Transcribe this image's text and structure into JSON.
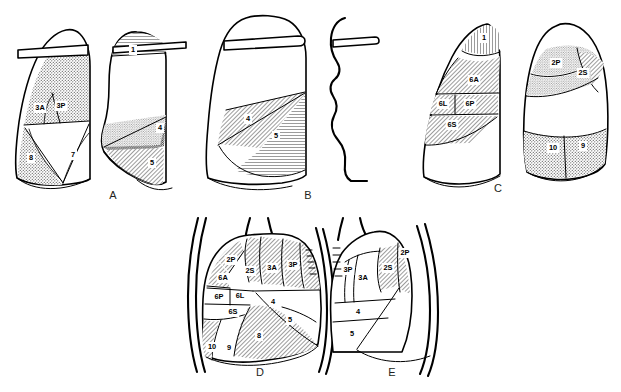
{
  "figure": {
    "background_color": "#ffffff",
    "ink_color": "#000000",
    "width": 621,
    "height": 392,
    "panels": [
      {
        "id": "A",
        "letter": "A",
        "letter_x": 113,
        "letter_y": 196,
        "description": "Right lung lateral and left lung lateral views",
        "segments": [
          {
            "label": "3A",
            "x": 40,
            "y": 108
          },
          {
            "label": "3P",
            "x": 61,
            "y": 106
          },
          {
            "label": "8",
            "x": 31,
            "y": 158
          },
          {
            "label": "7",
            "x": 73,
            "y": 155
          },
          {
            "label": "1",
            "x": 133,
            "y": 50
          },
          {
            "label": "4",
            "x": 160,
            "y": 128
          },
          {
            "label": "5",
            "x": 152,
            "y": 163
          }
        ]
      },
      {
        "id": "B",
        "letter": "B",
        "letter_x": 308,
        "letter_y": 196,
        "description": "Lung lateral view with middle lobe segments and profile trace",
        "segments": [
          {
            "label": "4",
            "x": 248,
            "y": 119
          },
          {
            "label": "5",
            "x": 276,
            "y": 136
          }
        ]
      },
      {
        "id": "C",
        "letter": "C",
        "letter_x": 498,
        "letter_y": 189,
        "description": "Right and left lung lateral views showing apical and superior segments",
        "segments": [
          {
            "label": "1",
            "x": 484,
            "y": 38
          },
          {
            "label": "6A",
            "x": 474,
            "y": 80
          },
          {
            "label": "6L",
            "x": 443,
            "y": 104
          },
          {
            "label": "6P",
            "x": 470,
            "y": 104
          },
          {
            "label": "6S",
            "x": 452,
            "y": 125
          },
          {
            "label": "2P",
            "x": 556,
            "y": 63
          },
          {
            "label": "2S",
            "x": 583,
            "y": 73
          },
          {
            "label": "10",
            "x": 553,
            "y": 148
          },
          {
            "label": "9",
            "x": 583,
            "y": 146
          }
        ]
      },
      {
        "id": "D",
        "letter": "D",
        "letter_x": 260,
        "letter_y": 373,
        "description": "Frontal view of right lung with all bronchopulmonary segments labelled",
        "segments": [
          {
            "label": "2P",
            "x": 231,
            "y": 260
          },
          {
            "label": "2S",
            "x": 250,
            "y": 271
          },
          {
            "label": "3A",
            "x": 272,
            "y": 268
          },
          {
            "label": "3P",
            "x": 293,
            "y": 265
          },
          {
            "label": "6A",
            "x": 223,
            "y": 278
          },
          {
            "label": "6P",
            "x": 219,
            "y": 297
          },
          {
            "label": "6L",
            "x": 240,
            "y": 296
          },
          {
            "label": "6S",
            "x": 233,
            "y": 312
          },
          {
            "label": "4",
            "x": 273,
            "y": 302
          },
          {
            "label": "5",
            "x": 290,
            "y": 320
          },
          {
            "label": "8",
            "x": 259,
            "y": 336
          },
          {
            "label": "9",
            "x": 229,
            "y": 348
          },
          {
            "label": "10",
            "x": 212,
            "y": 347
          }
        ]
      },
      {
        "id": "E",
        "letter": "E",
        "letter_x": 392,
        "letter_y": 373,
        "description": "Frontal view of left lung with bronchopulmonary segments labelled",
        "segments": [
          {
            "label": "3P",
            "x": 348,
            "y": 270
          },
          {
            "label": "3A",
            "x": 363,
            "y": 278
          },
          {
            "label": "2S",
            "x": 388,
            "y": 268
          },
          {
            "label": "2P",
            "x": 405,
            "y": 253
          },
          {
            "label": "4",
            "x": 358,
            "y": 312
          },
          {
            "label": "5",
            "x": 352,
            "y": 334
          }
        ]
      }
    ]
  }
}
